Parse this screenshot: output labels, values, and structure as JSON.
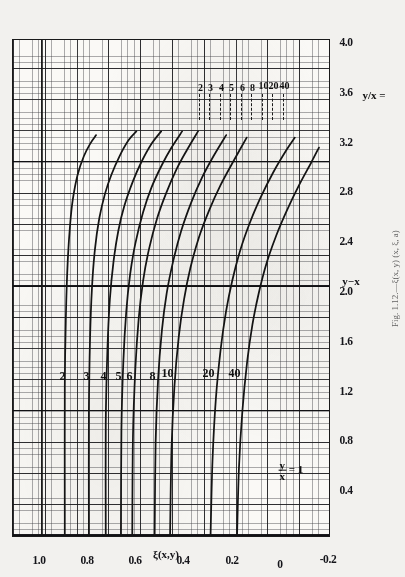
{
  "figure": {
    "caption": "Fig. 1.12.—ξ(x, y) (x, ξ, a)",
    "xaxis_title": "y−x",
    "yaxis_title": "ξ(x,y)",
    "ratio_axis_label": "y/x =",
    "curve_family_label_num": "y",
    "curve_family_label_den": "x",
    "curve_family_label_eq": "= 1"
  },
  "chart_data": {
    "type": "line",
    "xlabel": "y−x",
    "ylabel": "ξ(x,y)",
    "xlim": [
      0,
      4.0
    ],
    "ylim": [
      -0.2,
      1.12
    ],
    "grid": true,
    "legend": "inline curve labels",
    "xticks": [
      "0.4",
      "0.8",
      "1.2",
      "1.6",
      "2.0",
      "2.4",
      "2.8",
      "3.2",
      "3.6",
      "4.0"
    ],
    "xtick_values": [
      0.4,
      0.8,
      1.2,
      1.6,
      2.0,
      2.4,
      2.8,
      3.2,
      3.6,
      4.0
    ],
    "yticks": [
      "1.0",
      "0.8",
      "0.6",
      "0.4",
      "0.2",
      "0",
      "-0.2"
    ],
    "ytick_values": [
      1.0,
      0.8,
      0.6,
      0.4,
      0.2,
      0,
      -0.2
    ],
    "secondary_axis": {
      "label": "y/x =",
      "ticks": [
        "2",
        "3",
        "4",
        "5",
        "6",
        "8",
        "10",
        "20",
        "40"
      ],
      "values": [
        2,
        3,
        4,
        5,
        6,
        8,
        10,
        20,
        40
      ]
    },
    "series": [
      {
        "name": "1",
        "label": "y/x = 1",
        "asymptote": 1.0,
        "points": [
          [
            0,
            1.0
          ],
          [
            4.0,
            1.0
          ]
        ]
      },
      {
        "name": "2",
        "label": "2",
        "asymptote": 0.905,
        "points": [
          [
            0,
            0.905
          ],
          [
            1.2,
            0.905
          ],
          [
            1.8,
            0.9
          ],
          [
            2.2,
            0.893
          ],
          [
            2.5,
            0.883
          ],
          [
            2.7,
            0.872
          ],
          [
            2.9,
            0.852
          ],
          [
            3.05,
            0.826
          ],
          [
            3.15,
            0.8
          ],
          [
            3.22,
            0.775
          ]
        ]
      },
      {
        "name": "3",
        "label": "3",
        "asymptote": 0.805,
        "points": [
          [
            0,
            0.805
          ],
          [
            1.0,
            0.805
          ],
          [
            1.6,
            0.8
          ],
          [
            2.0,
            0.792
          ],
          [
            2.3,
            0.78
          ],
          [
            2.55,
            0.762
          ],
          [
            2.75,
            0.738
          ],
          [
            2.9,
            0.712
          ],
          [
            3.05,
            0.678
          ],
          [
            3.18,
            0.64
          ],
          [
            3.25,
            0.608
          ]
        ]
      },
      {
        "name": "4",
        "label": "4",
        "asymptote": 0.735,
        "points": [
          [
            0,
            0.735
          ],
          [
            0.9,
            0.735
          ],
          [
            1.5,
            0.728
          ],
          [
            1.9,
            0.718
          ],
          [
            2.2,
            0.703
          ],
          [
            2.45,
            0.683
          ],
          [
            2.65,
            0.658
          ],
          [
            2.85,
            0.622
          ],
          [
            3.0,
            0.588
          ],
          [
            3.15,
            0.545
          ],
          [
            3.25,
            0.505
          ]
        ]
      },
      {
        "name": "5",
        "label": "5",
        "asymptote": 0.672,
        "points": [
          [
            0,
            0.672
          ],
          [
            0.85,
            0.67
          ],
          [
            1.4,
            0.662
          ],
          [
            1.8,
            0.65
          ],
          [
            2.1,
            0.634
          ],
          [
            2.35,
            0.612
          ],
          [
            2.6,
            0.58
          ],
          [
            2.8,
            0.545
          ],
          [
            2.98,
            0.502
          ],
          [
            3.12,
            0.462
          ],
          [
            3.25,
            0.418
          ]
        ]
      },
      {
        "name": "6",
        "label": "6",
        "asymptote": 0.625,
        "points": [
          [
            0,
            0.625
          ],
          [
            0.8,
            0.622
          ],
          [
            1.35,
            0.612
          ],
          [
            1.75,
            0.598
          ],
          [
            2.05,
            0.58
          ],
          [
            2.3,
            0.556
          ],
          [
            2.55,
            0.522
          ],
          [
            2.75,
            0.485
          ],
          [
            2.95,
            0.44
          ],
          [
            3.1,
            0.398
          ],
          [
            3.25,
            0.352
          ]
        ]
      },
      {
        "name": "8",
        "label": "8",
        "asymptote": 0.532,
        "points": [
          [
            0,
            0.532
          ],
          [
            0.75,
            0.528
          ],
          [
            1.25,
            0.518
          ],
          [
            1.65,
            0.502
          ],
          [
            1.95,
            0.482
          ],
          [
            2.2,
            0.456
          ],
          [
            2.45,
            0.422
          ],
          [
            2.68,
            0.38
          ],
          [
            2.88,
            0.335
          ],
          [
            3.05,
            0.288
          ],
          [
            3.22,
            0.235
          ]
        ]
      },
      {
        "name": "10",
        "label": "10",
        "asymptote": 0.468,
        "points": [
          [
            0,
            0.468
          ],
          [
            0.7,
            0.462
          ],
          [
            1.2,
            0.45
          ],
          [
            1.6,
            0.432
          ],
          [
            1.9,
            0.41
          ],
          [
            2.15,
            0.384
          ],
          [
            2.4,
            0.348
          ],
          [
            2.62,
            0.305
          ],
          [
            2.82,
            0.258
          ],
          [
            3.0,
            0.208
          ],
          [
            3.2,
            0.15
          ]
        ]
      },
      {
        "name": "20",
        "label": "20",
        "asymptote": 0.3,
        "points": [
          [
            0,
            0.3
          ],
          [
            0.6,
            0.292
          ],
          [
            1.1,
            0.278
          ],
          [
            1.5,
            0.258
          ],
          [
            1.8,
            0.236
          ],
          [
            2.05,
            0.21
          ],
          [
            2.3,
            0.176
          ],
          [
            2.52,
            0.136
          ],
          [
            2.72,
            0.092
          ],
          [
            2.92,
            0.04
          ],
          [
            3.1,
            -0.015
          ],
          [
            3.2,
            -0.05
          ]
        ]
      },
      {
        "name": "40",
        "label": "40",
        "asymptote": 0.19,
        "points": [
          [
            0,
            0.19
          ],
          [
            0.55,
            0.182
          ],
          [
            1.0,
            0.168
          ],
          [
            1.4,
            0.148
          ],
          [
            1.7,
            0.126
          ],
          [
            1.95,
            0.1
          ],
          [
            2.2,
            0.066
          ],
          [
            2.42,
            0.026
          ],
          [
            2.62,
            -0.018
          ],
          [
            2.82,
            -0.068
          ],
          [
            3.0,
            -0.118
          ],
          [
            3.12,
            -0.15
          ]
        ]
      }
    ]
  }
}
